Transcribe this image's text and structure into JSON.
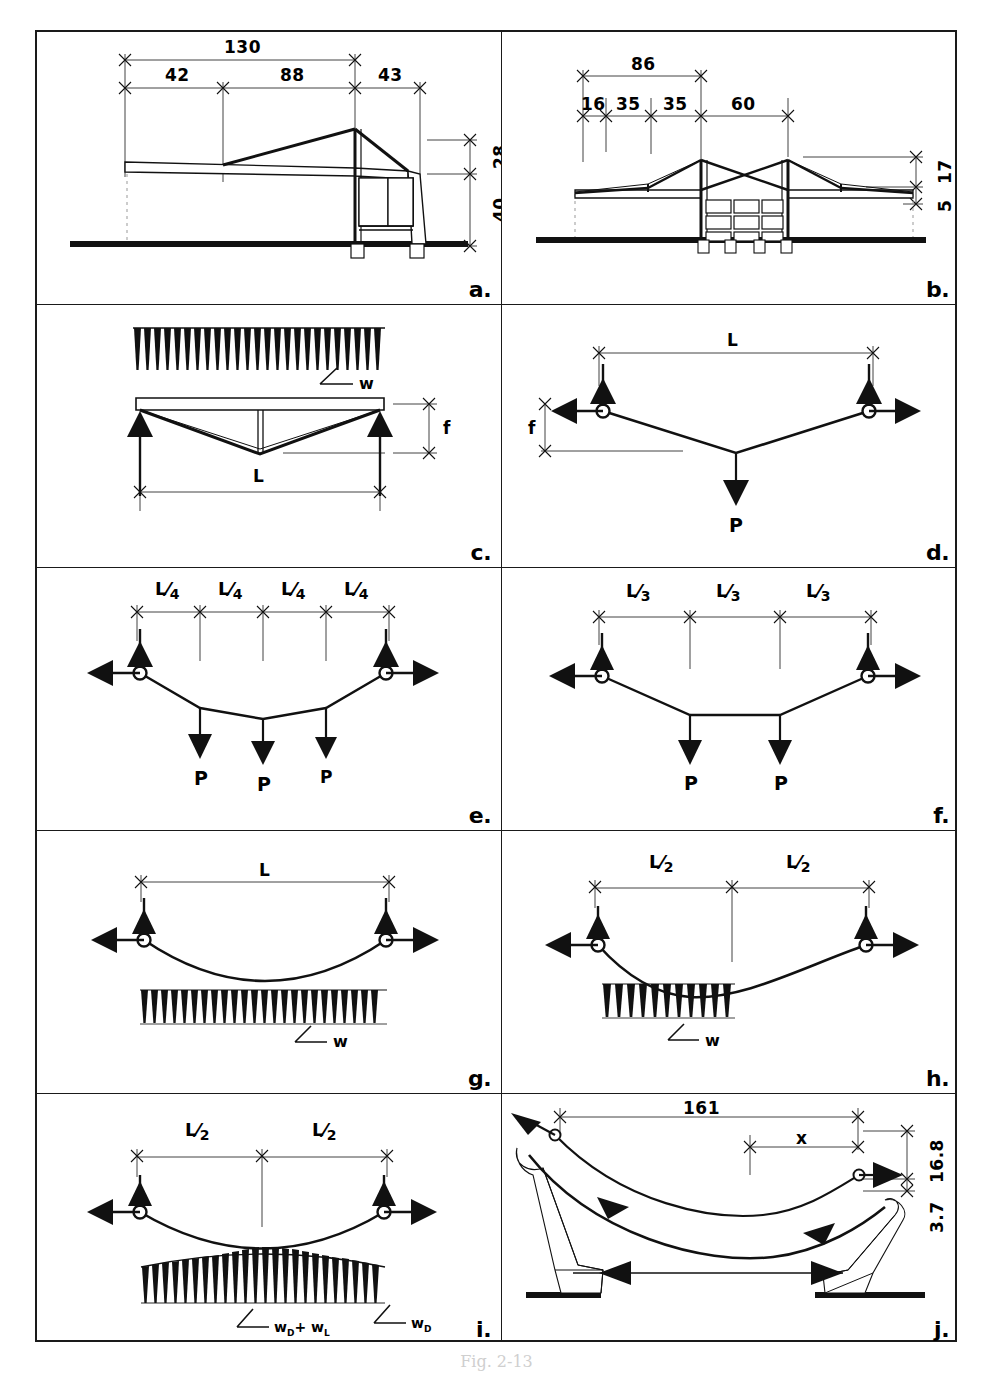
{
  "figure": {
    "caption": "Fig. 2-13",
    "panel_count": 10,
    "frame": {
      "border_color": "#1a1a1a",
      "background": "#ffffff"
    },
    "ink_color": "#111111"
  },
  "panels": [
    {
      "id": "a",
      "label": "a.",
      "kind": "single-mast-cable-roof-elevation",
      "description": "Elevation of a single mast cantilever roof with suspended deck and end bay frame over a ground line",
      "dimensions": [
        {
          "name": "overall-span",
          "value": "130",
          "orientation": "horizontal"
        },
        {
          "name": "left-bay",
          "value": "42",
          "orientation": "horizontal"
        },
        {
          "name": "middle-bay",
          "value": "88",
          "orientation": "horizontal"
        },
        {
          "name": "right-bay",
          "value": "43",
          "orientation": "horizontal"
        },
        {
          "name": "mast-height-above-deck",
          "value": "28",
          "orientation": "vertical"
        },
        {
          "name": "deck-height",
          "value": "40",
          "orientation": "vertical"
        }
      ]
    },
    {
      "id": "b",
      "label": "b.",
      "kind": "twin-tower-cable-stayed-elevation",
      "description": "Elevation of a twin tower cable stayed roof with crossing stays and a three by three framed substructure",
      "dimensions": [
        {
          "name": "tower-spacing",
          "value": "86",
          "orientation": "horizontal"
        },
        {
          "name": "segment-1",
          "value": "16",
          "orientation": "horizontal"
        },
        {
          "name": "segment-2",
          "value": "35",
          "orientation": "horizontal"
        },
        {
          "name": "segment-3",
          "value": "35",
          "orientation": "horizontal"
        },
        {
          "name": "segment-4",
          "value": "60",
          "orientation": "horizontal"
        },
        {
          "name": "tower-height",
          "value": "17",
          "orientation": "vertical"
        },
        {
          "name": "deck-depth",
          "value": "5",
          "orientation": "vertical"
        }
      ]
    },
    {
      "id": "c",
      "label": "c.",
      "kind": "cable-with-rigid-deck-uniform-load",
      "description": "Uniform load w applied to a rigid deck carried by a V shaped cable with vertical reactions at both ends",
      "load_label": "w",
      "dimensions": [
        {
          "name": "span",
          "value": "L",
          "orientation": "horizontal"
        },
        {
          "name": "sag",
          "value": "f",
          "orientation": "vertical"
        }
      ]
    },
    {
      "id": "d",
      "label": "d.",
      "kind": "cable-single-point-load",
      "description": "Cable with one concentrated load P at midspan, hinged supports with vertical and horizontal reactions",
      "point_loads": [
        "P"
      ],
      "dimensions": [
        {
          "name": "span",
          "value": "L",
          "orientation": "horizontal"
        },
        {
          "name": "sag",
          "value": "f",
          "orientation": "vertical"
        }
      ]
    },
    {
      "id": "e",
      "label": "e.",
      "kind": "cable-three-point-loads",
      "description": "Cable with three equal concentrated loads P at quarter points",
      "point_loads": [
        "P",
        "P",
        "P"
      ],
      "segments": [
        {
          "num": "L",
          "den": "4"
        },
        {
          "num": "L",
          "den": "4"
        },
        {
          "num": "L",
          "den": "4"
        },
        {
          "num": "L",
          "den": "4"
        }
      ]
    },
    {
      "id": "f",
      "label": "f.",
      "kind": "cable-two-point-loads",
      "description": "Cable with two equal concentrated loads P at third points",
      "point_loads": [
        "P",
        "P"
      ],
      "segments": [
        {
          "num": "L",
          "den": "3"
        },
        {
          "num": "L",
          "den": "3"
        },
        {
          "num": "L",
          "den": "3"
        }
      ]
    },
    {
      "id": "g",
      "label": "g.",
      "kind": "cable-full-uniform-load",
      "description": "Cable carrying a uniform load w over the entire span producing a parabolic shape",
      "load_label": "w",
      "dimensions": [
        {
          "name": "span",
          "value": "L",
          "orientation": "horizontal"
        }
      ]
    },
    {
      "id": "h",
      "label": "h.",
      "kind": "cable-half-span-uniform-load",
      "description": "Cable carrying a uniform load w over the left half span only giving an unsymmetrical shape",
      "load_label": "w",
      "segments": [
        {
          "num": "L",
          "den": "2"
        },
        {
          "num": "L",
          "den": "2"
        }
      ]
    },
    {
      "id": "i",
      "label": "i.",
      "kind": "cable-dead-plus-live-load",
      "description": "Cable under dead load plus live load with the combined load diagram peaking at midspan",
      "load_labels": [
        {
          "name": "dead-plus-live",
          "base": "w",
          "sub1": "D",
          "op": "+",
          "base2": "w",
          "sub2": "L"
        },
        {
          "name": "dead-only",
          "base": "w",
          "sub1": "D"
        }
      ],
      "segments": [
        {
          "num": "L",
          "den": "2"
        },
        {
          "num": "L",
          "den": "2"
        }
      ]
    },
    {
      "id": "j",
      "label": "j.",
      "kind": "cable-perspective-with-abutments",
      "description": "Perspective view of a suspended cable anchored to two inclined abutments with thrust force arrows",
      "dimensions": [
        {
          "name": "overall-length",
          "value": "161",
          "orientation": "horizontal"
        },
        {
          "name": "partial-length",
          "value": "x",
          "orientation": "horizontal"
        },
        {
          "name": "sag-upper",
          "value": "16.8",
          "orientation": "vertical"
        },
        {
          "name": "offset-lower",
          "value": "3.7",
          "orientation": "vertical"
        }
      ]
    }
  ]
}
